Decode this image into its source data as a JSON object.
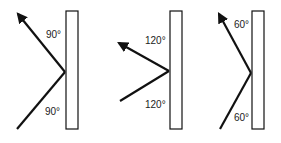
{
  "panels": [
    {
      "id": "panel-1",
      "angle_top": "90°",
      "angle_bottom": "90°"
    },
    {
      "id": "panel-2",
      "angle_top": "120°",
      "angle_bottom": "120°"
    },
    {
      "id": "panel-3",
      "angle_top": "60°",
      "angle_bottom": "60°"
    }
  ],
  "colors": {
    "line": "#111111",
    "wall_fill": "#ffffff",
    "background": "#ffffff"
  }
}
